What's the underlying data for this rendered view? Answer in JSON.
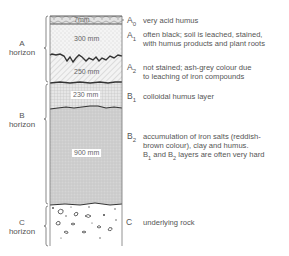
{
  "diagram": {
    "type": "soil-profile",
    "horizons": [
      {
        "id": "A",
        "label_line1": "A",
        "label_line2": "horizon"
      },
      {
        "id": "B",
        "label_line1": "B",
        "label_line2": "horizon"
      },
      {
        "id": "C",
        "label_line1": "C",
        "label_line2": "horizon"
      }
    ],
    "layers": [
      {
        "code": "A",
        "sub": "0",
        "thickness": "7mm",
        "description_lines": [
          "very acid humus"
        ]
      },
      {
        "code": "A",
        "sub": "1",
        "thickness": "300 mm",
        "description_lines": [
          "often black; soil is leached, stained,",
          "with humus products and plant roots"
        ]
      },
      {
        "code": "A",
        "sub": "2",
        "thickness": "250 mm",
        "description_lines": [
          "not stained;  ash-grey colour due",
          "to leaching of iron compounds"
        ]
      },
      {
        "code": "B",
        "sub": "1",
        "thickness": "230 mm",
        "description_lines": [
          "colloidal humus layer"
        ]
      },
      {
        "code": "B",
        "sub": "2",
        "thickness": "900 mm",
        "description_lines": [
          "accumulation of iron salts (reddish-",
          "brown colour), clay and humus."
        ]
      },
      {
        "code": "C",
        "sub": "",
        "thickness": "",
        "description_lines": [
          "underlying rock"
        ]
      }
    ],
    "note": {
      "pre": "B",
      "s1": "1",
      "mid": " and B",
      "s2": "2",
      "post": " layers are often very hard"
    }
  }
}
